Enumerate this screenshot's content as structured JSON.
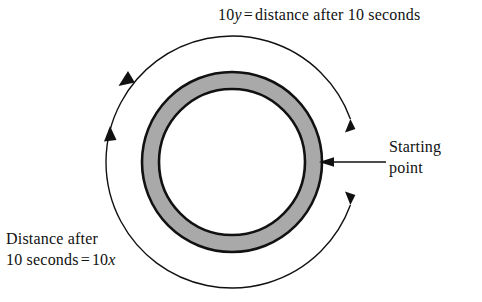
{
  "figure": {
    "type": "circular-track-diagram",
    "title_text": "",
    "background_color": "#ffffff",
    "stroke_color": "#111111",
    "track_fill_color": "#a9a9a9",
    "center": {
      "x": 232,
      "y": 162
    },
    "track_outer_radius": 90,
    "track_inner_radius": 73,
    "path_radius": 126,
    "start_point_angle_degrees": 0,
    "travel_direction": "counterclockwise"
  },
  "labels": {
    "top": {
      "variable": "10y",
      "equals": "=",
      "text": "distance after 10 seconds",
      "full": "10y = distance after 10 seconds"
    },
    "bottom_left": {
      "line1": "Distance after",
      "line2_prefix": "10 seconds",
      "equals": "=",
      "line2_value": "10x",
      "full": "Distance after 10 seconds = 10x"
    },
    "starting_point": {
      "line1": "Starting",
      "line2": "point",
      "full": "Starting point"
    }
  },
  "annotations": {
    "leader_arrow": {
      "name": "starting-point-leader",
      "direction": "left"
    },
    "arc_arrow_top_left": {
      "name": "ccw-arrow-top-left",
      "direction": "counterclockwise"
    },
    "arc_arrow_left": {
      "name": "ccw-arrow-left",
      "direction": "counterclockwise"
    },
    "gap_arrow_upper_right": {
      "name": "path-arrow-upper-right",
      "direction": "up"
    },
    "gap_arrow_lower_right": {
      "name": "path-arrow-lower-right",
      "direction": "down"
    }
  }
}
